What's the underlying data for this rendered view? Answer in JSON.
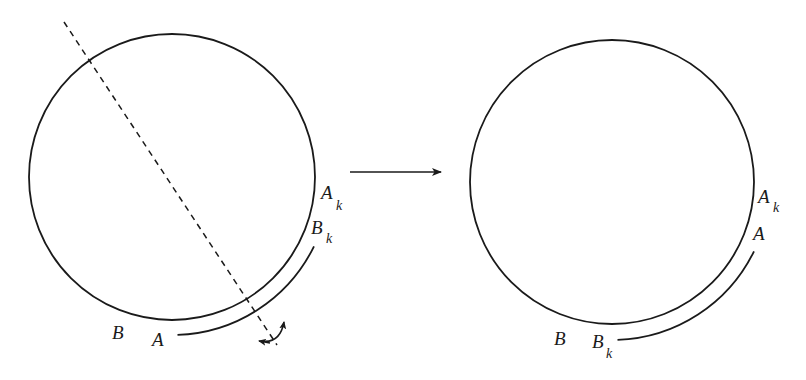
{
  "diagram": {
    "type": "circle-reflection-transformation",
    "stroke_color": "#1a1a1a",
    "background": "#ffffff",
    "left_figure": {
      "circle": {
        "cx": 172,
        "cy": 177,
        "r": 143
      },
      "outer_arc": {
        "r": 158,
        "start_deg": 26,
        "end_deg": 88
      },
      "axis_dashed_line": {
        "x1": 64,
        "y1": 22,
        "x2": 277,
        "y2": 345
      },
      "labels": {
        "A_k": {
          "main": "A",
          "sub": "k"
        },
        "B_k": {
          "main": "B",
          "sub": "k"
        },
        "B": "B",
        "A": "A"
      },
      "rotation_icon": "flip-rotate-arrow"
    },
    "transition_arrow": {
      "x1": 350,
      "y1": 172,
      "x2": 441,
      "y2": 172
    },
    "right_figure": {
      "circle": {
        "cx": 612,
        "cy": 182,
        "r": 142
      },
      "outer_arc": {
        "r": 158,
        "start_deg": 26,
        "end_deg": 88
      },
      "labels": {
        "A_k": {
          "main": "A",
          "sub": "k"
        },
        "A": "A",
        "B": "B",
        "B_k": {
          "main": "B",
          "sub": "k"
        }
      }
    }
  }
}
